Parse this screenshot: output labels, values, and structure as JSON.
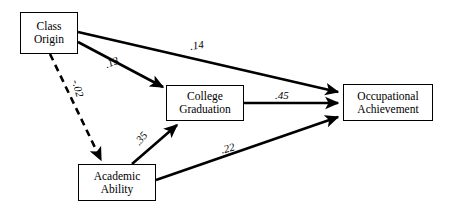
{
  "diagram": {
    "type": "path-diagram",
    "canvas": {
      "width": 449,
      "height": 214,
      "background": "#ffffff"
    },
    "ink_color": "#000000",
    "nodes": [
      {
        "id": "class-origin",
        "label_line1": "Class",
        "label_line2": "Origin",
        "x": 20,
        "y": 12,
        "w": 58,
        "h": 42
      },
      {
        "id": "college-graduation",
        "label_line1": "College",
        "label_line2": "Graduation",
        "x": 166,
        "y": 85,
        "w": 78,
        "h": 36
      },
      {
        "id": "occupational-achievement",
        "label_line1": "Occupational",
        "label_line2": "Achievement",
        "x": 343,
        "y": 84,
        "w": 90,
        "h": 37
      },
      {
        "id": "academic-ability",
        "label_line1": "Academic",
        "label_line2": "Ability",
        "x": 78,
        "y": 164,
        "w": 78,
        "h": 37
      }
    ],
    "edges": [
      {
        "id": "origin-to-occupation",
        "from": "class-origin",
        "to": "occupational-achievement",
        "coefficient": ".14",
        "style": "solid",
        "label_x": 190,
        "label_y": 40,
        "label_rotate": -8
      },
      {
        "id": "origin-to-college",
        "from": "class-origin",
        "to": "college-graduation",
        "coefficient": ".13",
        "style": "solid",
        "label_x": 105,
        "label_y": 57,
        "label_rotate": -22
      },
      {
        "id": "origin-to-ability",
        "from": "class-origin",
        "to": "academic-ability",
        "coefficient": "-.02",
        "style": "dashed",
        "label_x": 69,
        "label_y": 83,
        "label_rotate": 74
      },
      {
        "id": "college-to-occupation",
        "from": "college-graduation",
        "to": "occupational-achievement",
        "coefficient": ".45",
        "style": "solid",
        "label_x": 275,
        "label_y": 90,
        "label_rotate": 0
      },
      {
        "id": "ability-to-college",
        "from": "academic-ability",
        "to": "college-graduation",
        "coefficient": ".35",
        "style": "solid",
        "label_x": 134,
        "label_y": 133,
        "label_rotate": -50
      },
      {
        "id": "ability-to-occupation",
        "from": "academic-ability",
        "to": "occupational-achievement",
        "coefficient": ".22",
        "style": "solid",
        "label_x": 221,
        "label_y": 143,
        "label_rotate": -14
      }
    ]
  }
}
